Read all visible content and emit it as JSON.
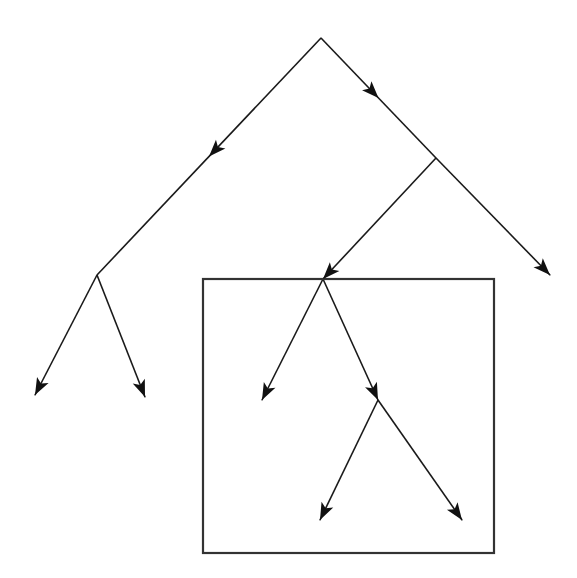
{
  "figure": {
    "title": "",
    "background_color": "#ffffff",
    "width": 577,
    "height": 578,
    "line_color": "#1a1a1a",
    "arrow_color": "#111111",
    "box_color": "#333333"
  },
  "diagram": {
    "type": "directed-binary-tree-with-region-box",
    "nodes": [
      {
        "id": "root",
        "name": "root-node",
        "x": 321,
        "y": 38,
        "label": ""
      },
      {
        "id": "n-left",
        "name": "level2-left-node",
        "x": 97,
        "y": 275,
        "label": ""
      },
      {
        "id": "n-right",
        "name": "level2-right-node",
        "x": 436,
        "y": 158,
        "label": ""
      },
      {
        "id": "n-boxtop",
        "name": "box-root-node",
        "x": 323,
        "y": 279,
        "label": ""
      },
      {
        "id": "n-boxmid",
        "name": "box-middle-node",
        "x": 378,
        "y": 400,
        "label": ""
      },
      {
        "id": "leaf-ll",
        "name": "leaf-far-left",
        "x": 35,
        "y": 395,
        "label": ""
      },
      {
        "id": "leaf-lr",
        "name": "leaf-left-right",
        "x": 145,
        "y": 397,
        "label": ""
      },
      {
        "id": "leaf-rr",
        "name": "leaf-far-right",
        "x": 550,
        "y": 275,
        "label": ""
      },
      {
        "id": "leaf-box-l",
        "name": "leaf-box-left",
        "x": 262,
        "y": 400,
        "label": ""
      },
      {
        "id": "leaf-box-bl",
        "name": "leaf-box-bottom-left",
        "x": 320,
        "y": 520,
        "label": ""
      },
      {
        "id": "leaf-box-br",
        "name": "leaf-box-bottom-right",
        "x": 462,
        "y": 520,
        "label": ""
      }
    ],
    "edges": [
      {
        "name": "edge-root-to-left",
        "from": "root",
        "to": "n-left",
        "arrow_at": 0.5,
        "x1": 321,
        "y1": 38,
        "x2": 97,
        "y2": 275
      },
      {
        "name": "edge-root-to-right",
        "from": "root",
        "to": "n-right",
        "arrow_at": 0.5,
        "x1": 321,
        "y1": 38,
        "x2": 436,
        "y2": 158
      },
      {
        "name": "edge-left-to-leaf-ll",
        "from": "n-left",
        "to": "leaf-ll",
        "arrow_at": 1.0,
        "x1": 97,
        "y1": 275,
        "x2": 35,
        "y2": 395
      },
      {
        "name": "edge-left-to-leaf-lr",
        "from": "n-left",
        "to": "leaf-lr",
        "arrow_at": 1.0,
        "x1": 97,
        "y1": 275,
        "x2": 145,
        "y2": 397
      },
      {
        "name": "edge-right-to-boxtop",
        "from": "n-right",
        "to": "n-boxtop",
        "arrow_at": 1.0,
        "x1": 436,
        "y1": 158,
        "x2": 323,
        "y2": 279
      },
      {
        "name": "edge-right-to-leaf-rr",
        "from": "n-right",
        "to": "leaf-rr",
        "arrow_at": 1.0,
        "x1": 436,
        "y1": 158,
        "x2": 550,
        "y2": 275
      },
      {
        "name": "edge-boxtop-to-leaf-boxl",
        "from": "n-boxtop",
        "to": "leaf-box-l",
        "arrow_at": 1.0,
        "x1": 323,
        "y1": 279,
        "x2": 262,
        "y2": 400
      },
      {
        "name": "edge-boxtop-to-boxmid",
        "from": "n-boxtop",
        "to": "n-boxmid",
        "arrow_at": 1.0,
        "x1": 323,
        "y1": 279,
        "x2": 378,
        "y2": 400
      },
      {
        "name": "edge-boxmid-to-bottom-l",
        "from": "n-boxmid",
        "to": "leaf-box-bl",
        "arrow_at": 1.0,
        "x1": 378,
        "y1": 400,
        "x2": 320,
        "y2": 520
      },
      {
        "name": "edge-boxmid-to-bottom-r",
        "from": "n-boxmid",
        "to": "leaf-box-br",
        "arrow_at": 1.0,
        "x1": 378,
        "y1": 400,
        "x2": 462,
        "y2": 520
      }
    ],
    "region_box": {
      "name": "highlight-region-box",
      "label": "",
      "x": 203,
      "y": 279,
      "width": 291,
      "height": 274
    },
    "arrow_head": {
      "length": 17,
      "half_width": 6.5,
      "notch": 4
    }
  }
}
